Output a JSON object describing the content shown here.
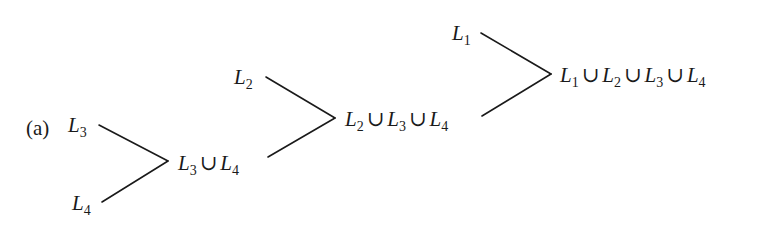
{
  "diagram": {
    "panel_label": "(a)",
    "nodes": [
      {
        "id": "L3",
        "base": "L",
        "sub": "3"
      },
      {
        "id": "L4",
        "base": "L",
        "sub": "4"
      },
      {
        "id": "L3uL4",
        "terms": [
          "3",
          "4"
        ]
      },
      {
        "id": "L2",
        "base": "L",
        "sub": "2"
      },
      {
        "id": "L2uL3uL4",
        "terms": [
          "2",
          "3",
          "4"
        ]
      },
      {
        "id": "L1",
        "base": "L",
        "sub": "1"
      },
      {
        "id": "L1uL2uL3uL4",
        "terms": [
          "1",
          "2",
          "3",
          "4"
        ]
      }
    ],
    "edges": [
      {
        "from": "L3",
        "to": "L3uL4"
      },
      {
        "from": "L4",
        "to": "L3uL4"
      },
      {
        "from": "L2",
        "to": "L2uL3uL4"
      },
      {
        "from": "L3uL4",
        "to": "L2uL3uL4"
      },
      {
        "from": "L1",
        "to": "L1uL2uL3uL4"
      },
      {
        "from": "L2uL3uL4",
        "to": "L1uL2uL3uL4"
      }
    ],
    "symbols": {
      "letter": "L",
      "union": "∪"
    },
    "line_color": "#1a1a1a"
  }
}
